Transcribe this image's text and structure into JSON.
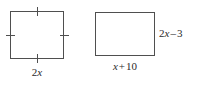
{
  "figure": {
    "kind": "geometry-diagram",
    "background_color": "#ffffff",
    "line_color": "#4f4f4f",
    "text_color": "#2b2b2b",
    "shapes": [
      {
        "name": "square",
        "tick_marks_per_side": 1,
        "sides_marked_congruent": true,
        "side_label": "2x"
      },
      {
        "name": "rectangle",
        "tick_marks_per_side": 0,
        "sides_marked_congruent": false,
        "width_label": "x + 10",
        "height_label": "2x – 3"
      }
    ]
  },
  "labels": {
    "square_side": {
      "full": "2x",
      "coefficient": "2",
      "variable": "x"
    },
    "rectangle_width": {
      "full": "x + 10",
      "variable": "x",
      "operator": "+",
      "constant": "10"
    },
    "rectangle_height": {
      "full": "2x – 3",
      "coefficient": "2",
      "variable": "x",
      "operator": "–",
      "constant": "3"
    }
  }
}
